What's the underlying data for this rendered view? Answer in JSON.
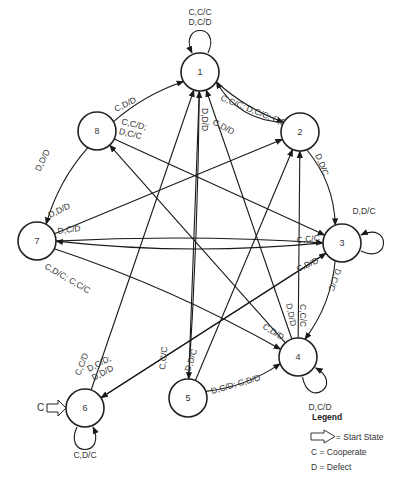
{
  "title": "",
  "states": [
    {
      "id": "1",
      "label": "1"
    },
    {
      "id": "2",
      "label": "2"
    },
    {
      "id": "3",
      "label": "3"
    },
    {
      "id": "4",
      "label": "4"
    },
    {
      "id": "5",
      "label": "5"
    },
    {
      "id": "6",
      "label": "6"
    },
    {
      "id": "7",
      "label": "7"
    },
    {
      "id": "8",
      "label": "8"
    }
  ],
  "start_state": {
    "state": "6",
    "label": "C"
  },
  "transitions": [
    {
      "from": "1",
      "to": "1",
      "label": [
        "C,C/C",
        "D,C/D"
      ]
    },
    {
      "from": "1",
      "to": "2",
      "label": [
        "C,D/D"
      ]
    },
    {
      "from": "2",
      "to": "1",
      "label": [
        "C,C/C; D,C/C; C,D/D"
      ]
    },
    {
      "from": "1",
      "to": "5",
      "label": [
        "D,D/D"
      ]
    },
    {
      "from": "2",
      "to": "3",
      "label": [
        "D,D/C"
      ]
    },
    {
      "from": "3",
      "to": "3",
      "label": [
        "D,D/C"
      ]
    },
    {
      "from": "3",
      "to": "4",
      "label": [
        "D,C/C"
      ]
    },
    {
      "from": "3",
      "to": "7",
      "label": [
        "C,C/C"
      ]
    },
    {
      "from": "3",
      "to": "6",
      "label": [
        "C,D/D"
      ]
    },
    {
      "from": "4",
      "to": "4",
      "label": [
        "D,C/D"
      ]
    },
    {
      "from": "4",
      "to": "1",
      "label": [
        "D,D/D"
      ]
    },
    {
      "from": "4",
      "to": "2",
      "label": [
        "C,C/C"
      ]
    },
    {
      "from": "4",
      "to": "8",
      "label": [
        "C,D/D"
      ]
    },
    {
      "from": "5",
      "to": "1",
      "label": [
        "C,C/C"
      ]
    },
    {
      "from": "5",
      "to": "2",
      "label": [
        "D,D/C"
      ]
    },
    {
      "from": "5",
      "to": "4",
      "label": [
        "D,C/D; C,D/D"
      ]
    },
    {
      "from": "6",
      "to": "6",
      "label": [
        "C,D/C"
      ]
    },
    {
      "from": "6",
      "to": "1",
      "label": [
        "C,C/D"
      ]
    },
    {
      "from": "6",
      "to": "3",
      "label": [
        "D,C/D;",
        "D,D/D"
      ]
    },
    {
      "from": "7",
      "to": "2",
      "label": [
        "D,D/D"
      ]
    },
    {
      "from": "7",
      "to": "3",
      "label": [
        "D,C/D"
      ]
    },
    {
      "from": "7",
      "to": "4",
      "label": [
        "C,D/C; C,C/C"
      ]
    },
    {
      "from": "8",
      "to": "1",
      "label": [
        "C,D/D"
      ]
    },
    {
      "from": "8",
      "to": "3",
      "label": [
        "C,C/D;",
        "D,C/C"
      ]
    },
    {
      "from": "8",
      "to": "7",
      "label": [
        "D,D/D"
      ]
    }
  ],
  "legend": {
    "title": "Legend",
    "items": [
      {
        "symbol": "start-arrow",
        "text": "= Start State"
      },
      {
        "symbol": "C",
        "text": "C = Cooperate"
      },
      {
        "symbol": "D",
        "text": "D = Defect"
      }
    ]
  }
}
